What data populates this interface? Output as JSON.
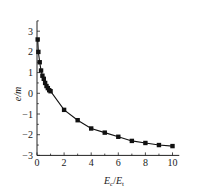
{
  "chart_data": {
    "type": "line",
    "title": "",
    "xlabel": "Ec/Et",
    "xlabel_parts": {
      "base1": "E",
      "sub1": "c",
      "sep": "/",
      "base2": "E",
      "sub2": "t"
    },
    "ylabel": "e/m",
    "xlim": [
      0,
      10.5
    ],
    "ylim": [
      -3,
      3.5
    ],
    "x_ticks": [
      0,
      2,
      4,
      6,
      8,
      10
    ],
    "y_ticks": [
      -3,
      -2,
      -1,
      0,
      1,
      2,
      3
    ],
    "grid": false,
    "legend": null,
    "marker": "square",
    "series": [
      {
        "name": "e",
        "x": [
          0.05,
          0.1,
          0.2,
          0.3,
          0.4,
          0.5,
          0.6,
          0.7,
          0.8,
          0.9,
          1.0,
          2,
          3,
          4,
          5,
          6,
          7,
          8,
          9,
          10
        ],
        "y": [
          2.6,
          2.0,
          1.5,
          1.1,
          0.85,
          0.7,
          0.5,
          0.35,
          0.25,
          0.15,
          0.1,
          -0.8,
          -1.3,
          -1.7,
          -1.9,
          -2.1,
          -2.3,
          -2.4,
          -2.5,
          -2.55
        ]
      }
    ]
  }
}
